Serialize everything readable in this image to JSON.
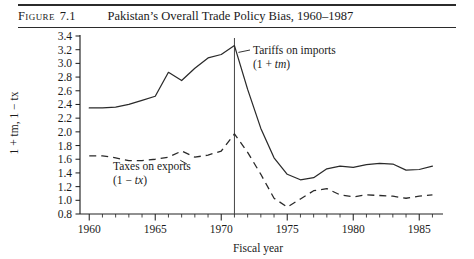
{
  "figure": {
    "label": "Figure",
    "number": "7.1",
    "title": "Pakistan’s Overall Trade Policy Bias, 1960–1987"
  },
  "colors": {
    "ink": "#2a2a2a",
    "rule": "#2b2b2b",
    "background": "#ffffff"
  },
  "annotations": {
    "imports": {
      "line1": "Tariffs on imports",
      "line2_pre": "(1 + ",
      "line2_var": "tm",
      "line2_post": ")"
    },
    "exports": {
      "line1": "Taxes on exports",
      "line2_pre": "(1 − ",
      "line2_var": "tx",
      "line2_post": ")"
    }
  },
  "axis_title_y": {
    "pre": "1 + ",
    "var1": "tm",
    "mid": ", 1 − ",
    "var2": "tx"
  },
  "chart_data": {
    "type": "line",
    "title": "Pakistan’s Overall Trade Policy Bias, 1960–1987",
    "xlabel": "Fiscal year",
    "ylabel": "1 + tm, 1 − tx",
    "xlim": [
      1959.3,
      1986.8
    ],
    "ylim": [
      0.8,
      3.4
    ],
    "ytick_step": 0.2,
    "yticks": [
      0.8,
      1.0,
      1.2,
      1.4,
      1.6,
      1.8,
      2.0,
      2.2,
      2.4,
      2.6,
      2.8,
      3.0,
      3.2,
      3.4
    ],
    "ytick_labels": [
      "0.8",
      "1.0",
      "1.2",
      "1.4",
      "1.6",
      "1.8",
      "2.0",
      "2.2",
      "2.4",
      "2.6",
      "2.8",
      "3.0",
      "3.2",
      "3.4"
    ],
    "xticks_major": [
      1960,
      1965,
      1970,
      1975,
      1980,
      1985
    ],
    "xtick_labels": [
      "1960",
      "1965",
      "1970",
      "1975",
      "1980",
      "1985"
    ],
    "xticks_minor_start": 1960,
    "xticks_minor_end": 1986,
    "grid": false,
    "legend": "annotated-inline",
    "reference_line_x": 1971,
    "x": [
      1960,
      1961,
      1962,
      1963,
      1964,
      1965,
      1966,
      1967,
      1968,
      1969,
      1970,
      1971,
      1972,
      1973,
      1974,
      1975,
      1976,
      1977,
      1978,
      1979,
      1980,
      1981,
      1982,
      1983,
      1984,
      1985,
      1986
    ],
    "series": [
      {
        "name": "Tariffs on imports (1 + tm)",
        "style": "solid",
        "values": [
          2.35,
          2.35,
          2.36,
          2.4,
          2.46,
          2.52,
          2.87,
          2.75,
          2.93,
          3.08,
          3.13,
          3.26,
          2.62,
          2.05,
          1.62,
          1.38,
          1.3,
          1.33,
          1.46,
          1.5,
          1.48,
          1.52,
          1.54,
          1.53,
          1.44,
          1.45,
          1.5
        ]
      },
      {
        "name": "Taxes on exports (1 − tx)",
        "style": "dashed",
        "values": [
          1.65,
          1.65,
          1.62,
          1.58,
          1.58,
          1.6,
          1.63,
          1.72,
          1.63,
          1.66,
          1.72,
          1.97,
          1.7,
          1.38,
          1.03,
          0.9,
          1.02,
          1.14,
          1.17,
          1.08,
          1.05,
          1.08,
          1.07,
          1.06,
          1.03,
          1.06,
          1.08
        ]
      }
    ]
  }
}
